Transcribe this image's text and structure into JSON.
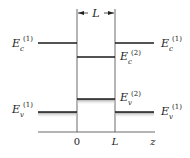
{
  "diagram": {
    "type": "quantum-well-band-diagram",
    "width_label": "L",
    "axis": {
      "label": "z",
      "ticks": [
        "0",
        "L"
      ]
    },
    "levels": {
      "ec1_left": {
        "base": "E",
        "sub": "c",
        "sup": "(1)"
      },
      "ec1_right": {
        "base": "E",
        "sub": "c",
        "sup": "(1)"
      },
      "ec2": {
        "base": "E",
        "sub": "c",
        "sup": "(2)"
      },
      "ev2": {
        "base": "E",
        "sub": "v",
        "sup": "(2)"
      },
      "ev1_left": {
        "base": "E",
        "sub": "v",
        "sup": "(1)"
      },
      "ev1_right": {
        "base": "E",
        "sub": "v",
        "sup": "(1)"
      }
    },
    "colors": {
      "line": "#1a1a1a",
      "shade": "#9a9a9a",
      "text": "#222222"
    }
  }
}
